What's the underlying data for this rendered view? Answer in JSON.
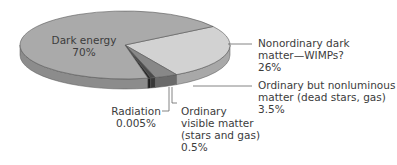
{
  "chart_data": {
    "type": "pie",
    "title": "",
    "style": "3d-exploded-none",
    "slices": [
      {
        "name": "Dark energy",
        "value": 70,
        "value_label": "70%",
        "label_lines": [
          "Dark energy",
          "70%"
        ],
        "color": "#aaaaaa",
        "side_color": "#8c8c8c"
      },
      {
        "name": "Nonordinary dark matter—WIMPs?",
        "value": 26,
        "value_label": "26%",
        "label_lines": [
          "Nonordinary dark",
          "matter—WIMPs?",
          "26%"
        ],
        "color": "#d2d2d2",
        "side_color": "#a8a8a8"
      },
      {
        "name": "Ordinary but nonluminous matter (dead stars, gas)",
        "value": 3.5,
        "value_label": "3.5%",
        "label_lines": [
          "Ordinary but nonluminous",
          "matter (dead stars, gas)",
          "3.5%"
        ],
        "color": "#888888",
        "side_color": "#6a6a6a"
      },
      {
        "name": "Ordinary visible matter (stars and gas)",
        "value": 0.5,
        "value_label": "0.5%",
        "label_lines": [
          "Ordinary",
          "visible matter",
          "(stars and gas)",
          "0.5%"
        ],
        "color": "#4a4a4a",
        "side_color": "#383838"
      },
      {
        "name": "Radiation",
        "value": 0.005,
        "value_label": "0.005%",
        "label_lines": [
          "Radiation",
          "0.005%"
        ],
        "color": "#2a2a2a",
        "side_color": "#1e1e1e"
      }
    ],
    "legend": "none"
  }
}
